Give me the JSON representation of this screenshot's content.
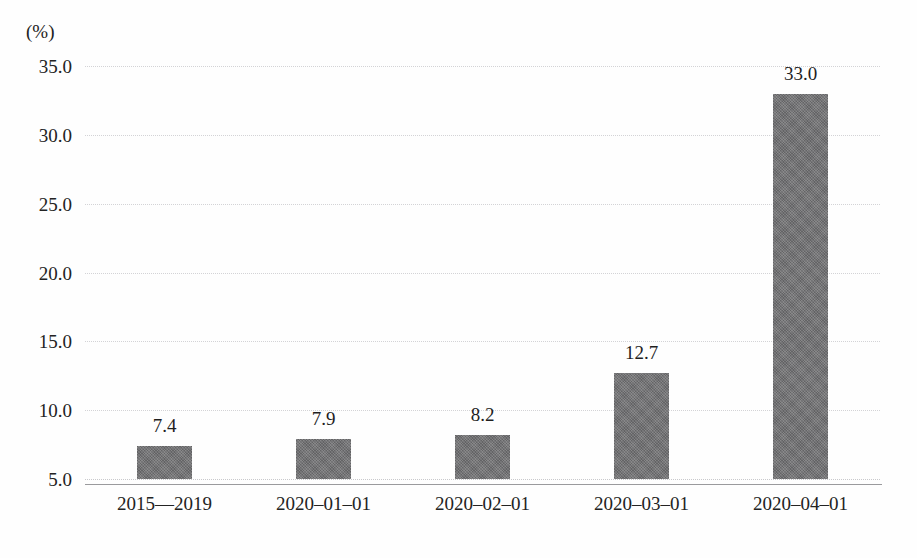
{
  "chart_data": {
    "type": "bar",
    "title": "",
    "subtitle": "",
    "xlabel": "",
    "ylabel": "(%)",
    "unit_label": "(%)",
    "categories": [
      "2015—2019",
      "2020–01–01",
      "2020–02–01",
      "2020–03–01",
      "2020–04–01"
    ],
    "values": [
      7.4,
      7.9,
      8.2,
      12.7,
      33.0
    ],
    "value_labels": [
      "7.4",
      "7.9",
      "8.2",
      "12.7",
      "33.0"
    ],
    "ylim": [
      5.0,
      35.0
    ],
    "ytick_values": [
      35.0,
      30.0,
      25.0,
      20.0,
      15.0,
      10.0,
      5.0
    ],
    "ytick_labels": [
      "35.0",
      "30.0",
      "25.0",
      "20.0",
      "15.0",
      "10.0",
      "5.0"
    ],
    "grid": true,
    "grid_style": "dotted-horizontal",
    "legend": false,
    "legend_position": "none",
    "bar_color": "#6f6f71",
    "grid_color": "#d3d3d6",
    "axis_color": "#9a9a9d",
    "text_color": "#232323",
    "background_color": "#fefefe"
  }
}
